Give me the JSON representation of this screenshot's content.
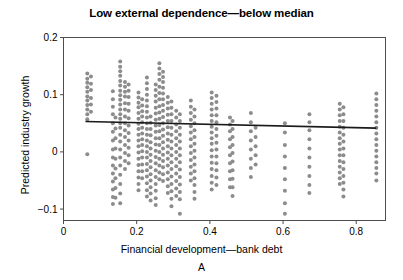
{
  "chart_data": {
    "type": "scatter",
    "title": "Low external dependence—below median",
    "xlabel": "Financial development—bank debt",
    "ylabel": "Predicted industry growth",
    "panel_label": "A",
    "xlim": [
      0.0,
      0.88
    ],
    "ylim": [
      -0.12,
      0.2
    ],
    "xticks": [
      0,
      0.2,
      0.4,
      0.6,
      0.8
    ],
    "xtick_labels": [
      "0",
      "0.2",
      "0.4",
      "0.6",
      "0.8"
    ],
    "yticks": [
      -0.1,
      0,
      0.1,
      0.2
    ],
    "ytick_labels": [
      "−0.1",
      "0",
      "0.1",
      "0.2"
    ],
    "grid": false,
    "legend": null,
    "marker_color": "#8c8c8c",
    "marker_size": 2.0,
    "fit_line_color": "#1a1a1a",
    "frame_color": "#4d4d4d",
    "fit_line": {
      "x_start": 0.06,
      "y_start": 0.053,
      "x_end": 0.855,
      "y_end": 0.0415
    },
    "series": [
      {
        "name": "industries",
        "clusters": [
          {
            "x": 0.065,
            "values": [
              0.137,
              0.128,
              0.121,
              0.113,
              0.105,
              0.097,
              0.09,
              0.082,
              0.074,
              0.066,
              0.057,
              -0.004
            ]
          },
          {
            "x": 0.075,
            "values": [
              0.132,
              0.119,
              0.108,
              0.094,
              0.083,
              0.07
            ]
          },
          {
            "x": 0.135,
            "values": [
              0.106,
              0.092,
              0.079,
              0.066,
              0.05,
              0.035,
              0.02,
              0.004,
              -0.01,
              -0.024,
              -0.038,
              -0.052,
              -0.066,
              -0.079,
              -0.091
            ]
          },
          {
            "x": 0.142,
            "values": [
              0.06,
              0.041,
              0.024,
              0.006,
              -0.012,
              -0.029,
              -0.046,
              -0.063,
              -0.08
            ]
          },
          {
            "x": 0.155,
            "values": [
              0.158,
              0.149,
              0.141,
              0.133,
              0.124,
              0.116,
              0.107,
              0.099,
              0.091,
              0.083,
              0.074,
              0.066,
              0.058,
              0.05,
              0.042,
              0.03,
              0.018,
              0.004,
              -0.01,
              -0.024,
              -0.04,
              -0.056,
              -0.073,
              -0.09
            ]
          },
          {
            "x": 0.168,
            "values": [
              0.122,
              0.114,
              0.105,
              0.097,
              0.085,
              0.074,
              0.062,
              0.05,
              0.038,
              0.026,
              0.012,
              -0.002,
              -0.016,
              -0.03
            ]
          },
          {
            "x": 0.178,
            "values": [
              0.118,
              0.107,
              0.096,
              0.084,
              0.072,
              0.059,
              0.046,
              0.033,
              0.02,
              0.007,
              -0.006,
              -0.02
            ]
          },
          {
            "x": 0.205,
            "values": [
              0.104,
              0.095,
              0.086,
              0.078,
              0.068,
              0.058,
              0.049,
              0.04,
              0.03,
              0.02,
              0.01,
              -0.001,
              -0.012,
              -0.023,
              -0.034,
              -0.045,
              -0.056,
              -0.067
            ]
          },
          {
            "x": 0.215,
            "values": [
              0.092,
              0.081,
              0.071,
              0.062,
              0.052,
              0.042,
              0.032,
              0.022,
              0.012,
              0.001,
              -0.01,
              -0.022,
              -0.034,
              -0.046
            ]
          },
          {
            "x": 0.228,
            "values": [
              0.13,
              0.12,
              0.11,
              0.1,
              0.09,
              0.08,
              0.07,
              0.06,
              0.05,
              0.04,
              0.03,
              0.02,
              0.01,
              0.0,
              -0.01,
              -0.021,
              -0.032,
              -0.043,
              -0.055,
              -0.067,
              -0.078
            ]
          },
          {
            "x": 0.238,
            "values": [
              0.062,
              0.051,
              0.04,
              0.029,
              0.017,
              0.006,
              -0.005,
              -0.016,
              -0.027,
              -0.039,
              -0.05,
              -0.062,
              -0.073,
              -0.085
            ]
          },
          {
            "x": 0.252,
            "values": [
              0.118,
              0.108,
              0.098,
              0.088,
              0.077,
              0.067,
              0.056,
              0.046,
              0.035,
              0.024,
              0.013,
              0.002,
              -0.009,
              -0.02,
              -0.032,
              -0.044,
              -0.056,
              -0.068,
              -0.081,
              -0.093
            ]
          },
          {
            "x": 0.262,
            "values": [
              0.155,
              0.146,
              0.136,
              0.126,
              0.114,
              0.103,
              0.092,
              0.08,
              0.069,
              0.058,
              0.047,
              0.036,
              0.024,
              0.012,
              0.0,
              -0.012,
              -0.024,
              -0.036,
              -0.048
            ]
          },
          {
            "x": 0.272,
            "values": [
              0.14,
              0.131,
              0.122,
              0.112,
              0.102,
              0.092,
              0.082,
              0.072,
              0.061,
              0.05,
              0.039,
              0.028,
              0.017,
              0.006,
              -0.005,
              -0.016,
              -0.027,
              -0.039,
              -0.051
            ]
          },
          {
            "x": 0.285,
            "values": [
              0.096,
              0.086,
              0.076,
              0.065,
              0.054,
              0.043,
              0.032,
              0.021,
              0.01,
              -0.001,
              -0.012,
              -0.024,
              -0.036,
              -0.048,
              -0.06,
              -0.072
            ]
          },
          {
            "x": 0.295,
            "values": [
              0.088,
              0.077,
              0.066,
              0.054,
              0.042,
              0.03,
              0.018,
              0.006,
              -0.006,
              -0.018,
              -0.03,
              -0.043,
              -0.056,
              -0.069,
              -0.082,
              -0.095
            ]
          },
          {
            "x": 0.308,
            "values": [
              0.072,
              0.06,
              0.048,
              0.036,
              0.024,
              0.012,
              0.0,
              -0.012,
              -0.025,
              -0.038,
              -0.051,
              -0.064,
              -0.077
            ]
          },
          {
            "x": 0.318,
            "values": [
              0.066,
              0.054,
              0.042,
              0.03,
              0.018,
              0.006,
              -0.006,
              -0.018,
              -0.031,
              -0.044,
              -0.057,
              -0.07,
              -0.083,
              -0.108
            ]
          },
          {
            "x": 0.348,
            "values": [
              0.09,
              0.079,
              0.068,
              0.056,
              0.045,
              0.034,
              0.022,
              0.01,
              -0.002,
              -0.014,
              -0.026,
              -0.038,
              -0.05
            ]
          },
          {
            "x": 0.358,
            "values": [
              0.074,
              0.062,
              0.05,
              0.038,
              0.026,
              0.014,
              0.002,
              -0.01,
              -0.022,
              -0.034,
              -0.046,
              -0.058,
              -0.07,
              -0.082
            ]
          },
          {
            "x": 0.405,
            "values": [
              0.104,
              0.094,
              0.084,
              0.074,
              0.064,
              0.054,
              0.044,
              0.034,
              0.024,
              0.014,
              0.003,
              -0.008,
              -0.019,
              -0.03,
              -0.042,
              -0.054,
              -0.066
            ]
          },
          {
            "x": 0.418,
            "values": [
              0.098,
              0.087,
              0.076,
              0.064,
              0.052,
              0.04,
              0.028,
              0.016,
              0.004,
              -0.008,
              -0.02,
              -0.032,
              -0.045,
              -0.058
            ]
          },
          {
            "x": 0.455,
            "values": [
              0.06,
              0.048,
              0.036,
              0.022,
              0.008,
              -0.006,
              -0.02,
              -0.034,
              -0.048,
              -0.062
            ]
          },
          {
            "x": 0.462,
            "values": [
              0.054,
              0.04,
              0.026,
              0.012,
              -0.002,
              -0.017,
              -0.032,
              -0.047,
              -0.062,
              -0.077
            ]
          },
          {
            "x": 0.512,
            "values": [
              0.068,
              0.052,
              0.036,
              0.02,
              0.004,
              -0.012,
              -0.028,
              -0.044
            ]
          },
          {
            "x": 0.525,
            "values": [
              0.042,
              0.026,
              0.01,
              -0.006,
              -0.022
            ]
          },
          {
            "x": 0.605,
            "values": [
              0.05,
              0.034,
              0.012,
              -0.008,
              -0.028,
              -0.048,
              -0.068,
              -0.09,
              -0.108
            ]
          },
          {
            "x": 0.672,
            "values": [
              0.066,
              0.052,
              0.038,
              0.022,
              0.006,
              -0.01,
              -0.026,
              -0.042,
              -0.058,
              -0.072
            ]
          },
          {
            "x": 0.755,
            "values": [
              0.084,
              0.074,
              0.064,
              0.054,
              0.044,
              0.034,
              0.024,
              0.014,
              0.004,
              -0.006,
              -0.016,
              -0.026,
              -0.036,
              -0.046,
              -0.056
            ]
          },
          {
            "x": 0.765,
            "values": [
              0.078,
              0.066,
              0.054,
              0.042,
              0.03,
              0.018,
              0.006,
              -0.006,
              -0.018,
              -0.03,
              -0.042,
              -0.054,
              -0.066,
              -0.078
            ]
          },
          {
            "x": 0.855,
            "values": [
              0.102,
              0.092,
              0.082,
              0.072,
              0.062,
              0.052,
              0.042,
              0.032,
              0.022,
              0.012,
              0.002,
              -0.008,
              -0.018,
              -0.028,
              -0.038,
              -0.05
            ]
          }
        ]
      }
    ]
  }
}
